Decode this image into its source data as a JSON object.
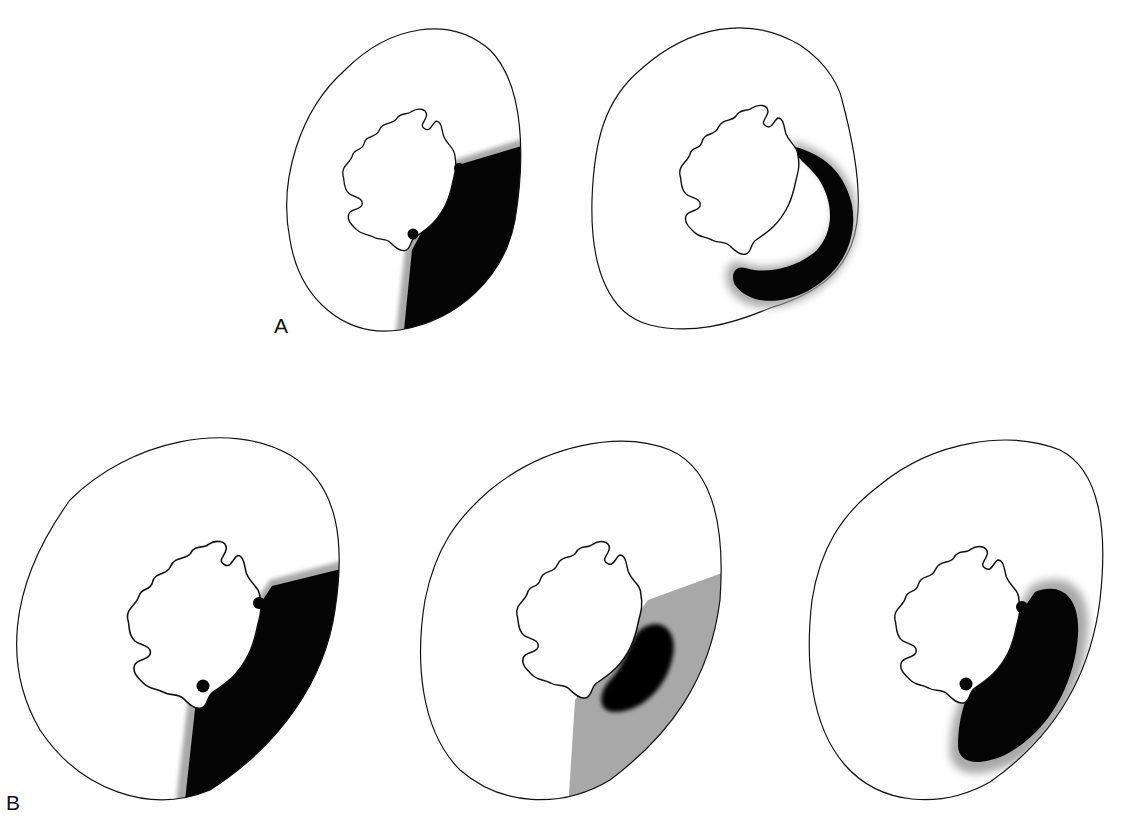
{
  "figure": {
    "colors": {
      "background": "#ffffff",
      "outline": "#111111",
      "infarct": "#050505",
      "border_zone": "#a8a8a8"
    },
    "panels": [
      {
        "id": "A",
        "label": "A",
        "sections": [
          {
            "name": "A-transmural-wedge",
            "pattern": "transmural infarct, lateral wall"
          },
          {
            "name": "A-subendocardial-ring",
            "pattern": "subendocardial infarct band"
          }
        ]
      },
      {
        "id": "B",
        "label": "B",
        "sections": [
          {
            "name": "B-transmural-wedge",
            "pattern": "transmural infarct"
          },
          {
            "name": "B-gray-area-at-risk",
            "pattern": "area at risk (gray) with small subendocardial core (black)"
          },
          {
            "name": "B-large-core-with-rim",
            "pattern": "large infarct core with gray border rim"
          }
        ]
      }
    ]
  }
}
